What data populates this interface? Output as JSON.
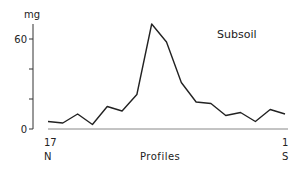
{
  "chart_data": {
    "type": "line",
    "title": "Subsoil",
    "xlabel": "Profiles",
    "ylabel": "mg",
    "ylim": [
      0,
      70
    ],
    "yticks": [
      0,
      20,
      40,
      60
    ],
    "ytick_labels": {
      "0": "0",
      "60": "60"
    },
    "x": [
      17,
      16,
      15,
      14,
      13,
      12,
      11,
      10,
      9,
      8,
      7,
      6,
      5,
      4,
      3,
      2,
      1
    ],
    "values": [
      5,
      4,
      10,
      3,
      15,
      12,
      23,
      70,
      58,
      31,
      18,
      17,
      9,
      11,
      5,
      13,
      10
    ],
    "x_start_label": "17",
    "x_end_label": "1",
    "x_start_direction": "N",
    "x_end_direction": "S",
    "grid": false
  }
}
